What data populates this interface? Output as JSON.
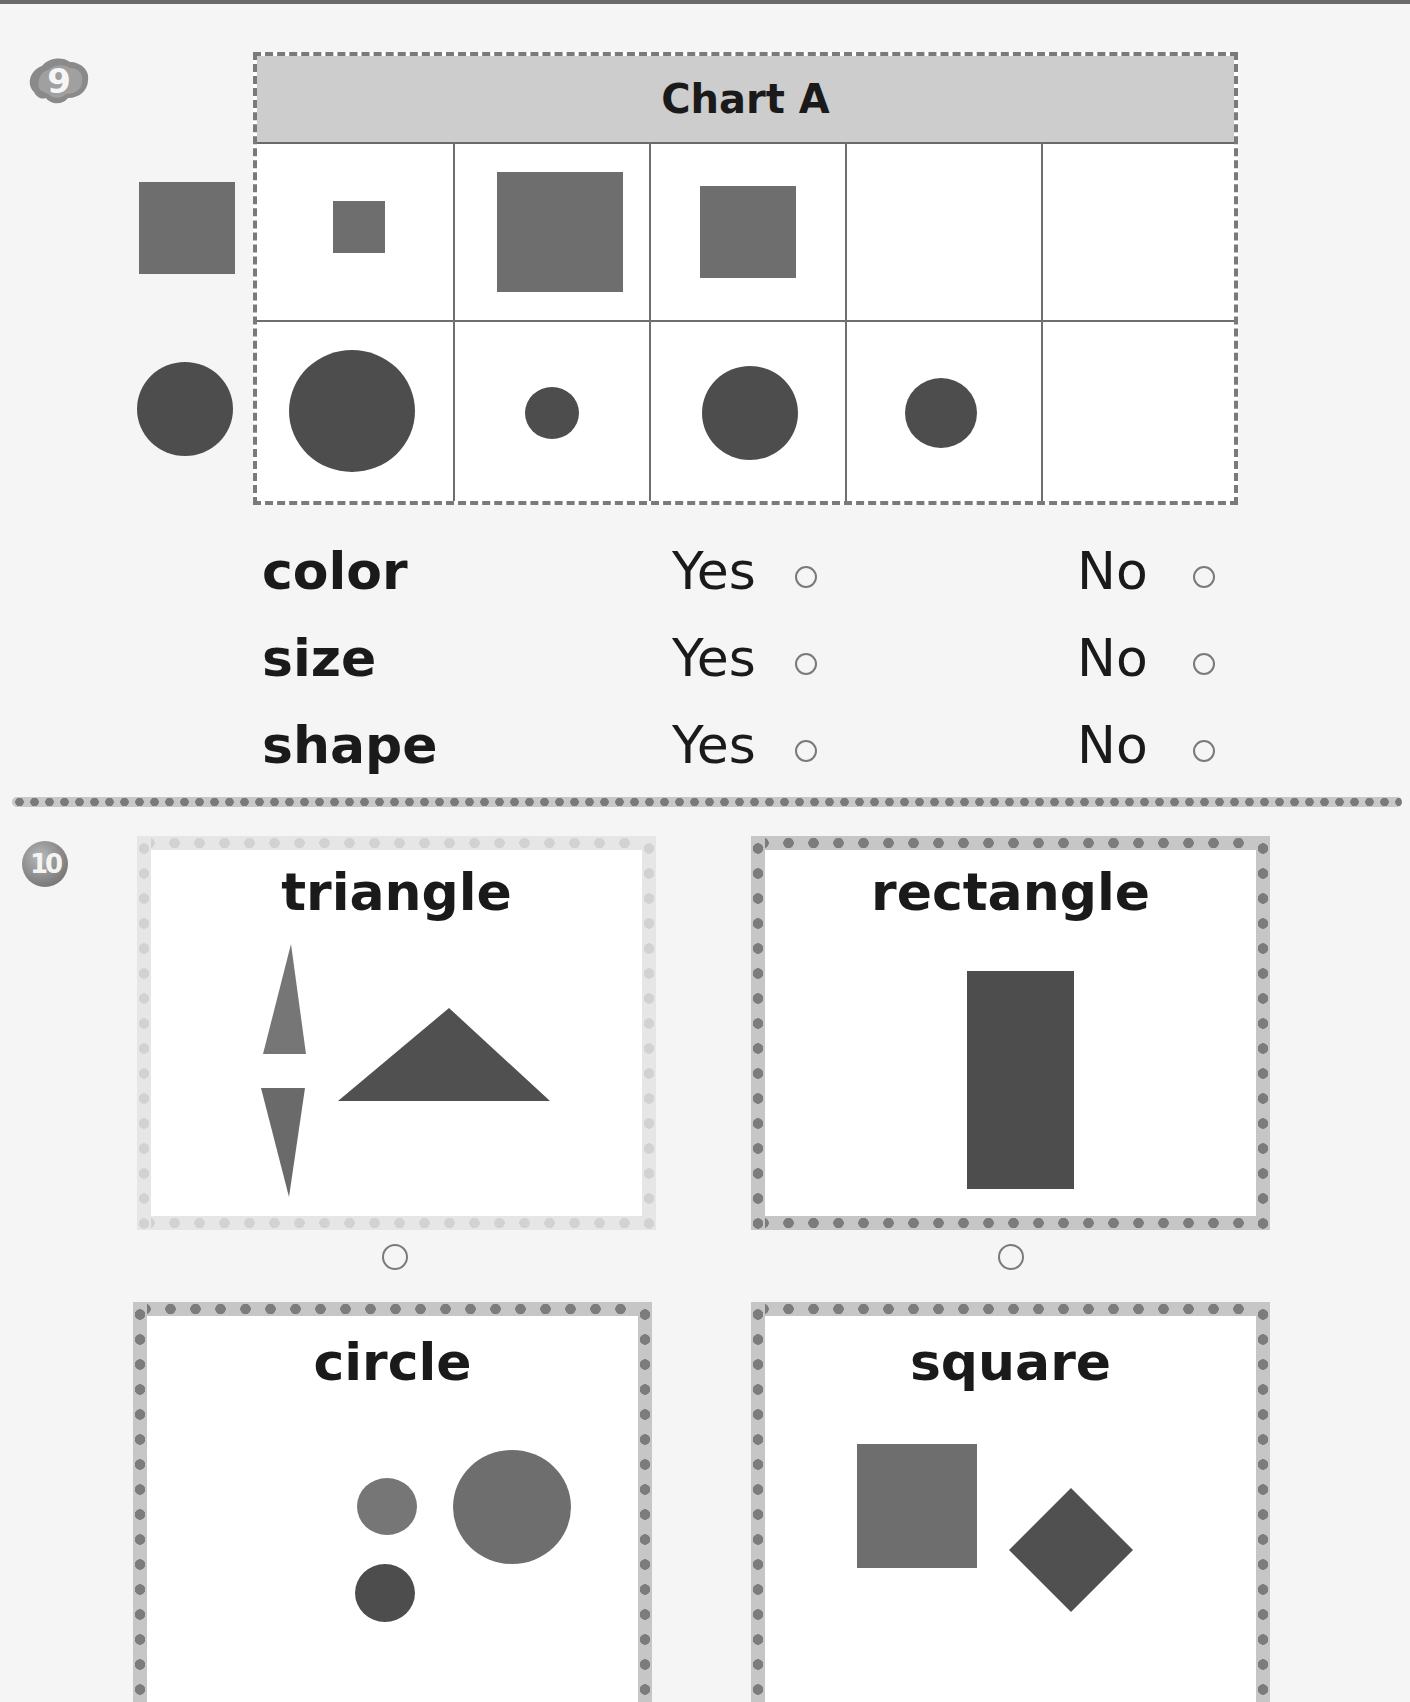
{
  "problem_9": {
    "number": "9",
    "chart": {
      "title": "Chart A",
      "rows": [
        {
          "row_label": "squares",
          "outside_shape": "medium square",
          "cells": [
            "small square",
            "large square",
            "medium square",
            "",
            ""
          ]
        },
        {
          "row_label": "circles",
          "outside_shape": "medium circle",
          "cells": [
            "large circle",
            "small circle",
            "medium circle",
            "small-medium circle",
            ""
          ]
        }
      ]
    },
    "questions": [
      {
        "label": "color",
        "yes": "Yes",
        "no": "No"
      },
      {
        "label": "size",
        "yes": "Yes",
        "no": "No"
      },
      {
        "label": "shape",
        "yes": "Yes",
        "no": "No"
      }
    ]
  },
  "problem_10": {
    "number": "10",
    "cards": [
      {
        "title": "triangle"
      },
      {
        "title": "rectangle"
      },
      {
        "title": "circle"
      },
      {
        "title": "square"
      }
    ]
  },
  "colors": {
    "shape_fill": "#6e6e6e",
    "shape_dark": "#4d4d4d",
    "header_bg": "#cdcdcd",
    "border": "#7a7a7a"
  }
}
